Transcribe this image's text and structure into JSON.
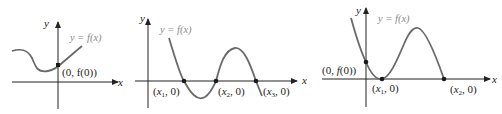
{
  "diagrams": [
    {
      "id": "graph-1",
      "function_label": "y = f(x)",
      "axis_x_label": "x",
      "axis_y_label": "y",
      "points": [
        {
          "label": "(0, f(0))"
        }
      ]
    },
    {
      "id": "graph-2",
      "function_label": "y = f(x)",
      "axis_x_label": "x",
      "axis_y_label": "y",
      "points": [
        {
          "label": "(x1, 0)"
        },
        {
          "label": "(x2, 0)"
        },
        {
          "label": "(x3, 0)"
        }
      ]
    },
    {
      "id": "graph-3",
      "function_label": "y = f(x)",
      "axis_x_label": "x",
      "axis_y_label": "y",
      "points": [
        {
          "label": "(0, f(0))"
        },
        {
          "label": "(x1, 0)"
        },
        {
          "label": "(x2, 0)"
        }
      ]
    }
  ],
  "colors": {
    "curve": "#6a6a6a",
    "axis": "#222222",
    "point": "#1a1a1a",
    "function_label": "#8a8a8a"
  }
}
